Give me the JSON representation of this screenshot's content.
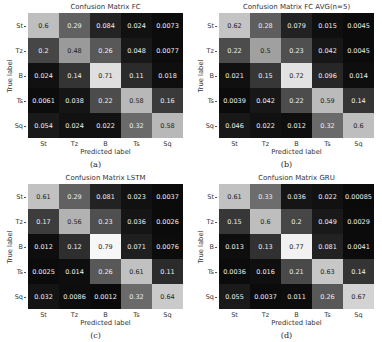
{
  "chart_data": [
    {
      "type": "heatmap",
      "title": "Confusion Matrix FC",
      "xlabel": "Predicted label",
      "ylabel": "True label",
      "x_categories": [
        "St",
        "Tz",
        "B",
        "Ts",
        "Sq"
      ],
      "y_categories": [
        "St",
        "Tz",
        "B",
        "Ts",
        "Sq"
      ],
      "values": [
        [
          "0.6",
          "0.29",
          "0.084",
          "0.024",
          "0.0073"
        ],
        [
          "0.2",
          "0.48",
          "0.26",
          "0.048",
          "0.0077"
        ],
        [
          "0.024",
          "0.14",
          "0.71",
          "0.11",
          "0.018"
        ],
        [
          "0.0061",
          "0.038",
          "0.22",
          "0.58",
          "0.16"
        ],
        [
          "0.054",
          "0.024",
          "0.022",
          "0.32",
          "0.58"
        ]
      ],
      "colormap": "grayscale",
      "caption": "(a)"
    },
    {
      "type": "heatmap",
      "title": "Confusion Matrix FC AVG(n=5)",
      "xlabel": "Predicted label",
      "ylabel": "True label",
      "x_categories": [
        "St",
        "Tz",
        "B",
        "Ts",
        "Sq"
      ],
      "y_categories": [
        "St",
        "Tz",
        "B",
        "Ts",
        "Sq"
      ],
      "values": [
        [
          "0.62",
          "0.28",
          "0.079",
          "0.015",
          "0.0045"
        ],
        [
          "0.22",
          "0.5",
          "0.23",
          "0.042",
          "0.0045"
        ],
        [
          "0.021",
          "0.15",
          "0.72",
          "0.096",
          "0.014"
        ],
        [
          "0.0039",
          "0.042",
          "0.22",
          "0.59",
          "0.14"
        ],
        [
          "0.046",
          "0.022",
          "0.012",
          "0.32",
          "0.6"
        ]
      ],
      "colormap": "grayscale",
      "caption": "(b)"
    },
    {
      "type": "heatmap",
      "title": "Confusion Matrix LSTM",
      "xlabel": "Predicted label",
      "ylabel": "True label",
      "x_categories": [
        "St",
        "Tz",
        "B",
        "Ts",
        "Sq"
      ],
      "y_categories": [
        "St",
        "Tz",
        "B",
        "Ts",
        "Sq"
      ],
      "values": [
        [
          "0.61",
          "0.29",
          "0.081",
          "0.023",
          "0.0037"
        ],
        [
          "0.17",
          "0.56",
          "0.23",
          "0.036",
          "0.0026"
        ],
        [
          "0.012",
          "0.12",
          "0.79",
          "0.071",
          "0.0076"
        ],
        [
          "0.0025",
          "0.014",
          "0.26",
          "0.61",
          "0.11"
        ],
        [
          "0.032",
          "0.0086",
          "0.0012",
          "0.32",
          "0.64"
        ]
      ],
      "colormap": "grayscale",
      "caption": "(c)"
    },
    {
      "type": "heatmap",
      "title": "Confusion Matrix GRU",
      "xlabel": "Predicted label",
      "ylabel": "True label",
      "x_categories": [
        "St",
        "Tz",
        "B",
        "Ts",
        "Sq"
      ],
      "y_categories": [
        "St",
        "Tz",
        "B",
        "Ts",
        "Sq"
      ],
      "values": [
        [
          "0.61",
          "0.33",
          "0.036",
          "0.022",
          "0.00085"
        ],
        [
          "0.15",
          "0.6",
          "0.2",
          "0.049",
          "0.0029"
        ],
        [
          "0.013",
          "0.13",
          "0.77",
          "0.081",
          "0.0041"
        ],
        [
          "0.0036",
          "0.016",
          "0.21",
          "0.63",
          "0.14"
        ],
        [
          "0.055",
          "0.0037",
          "0.011",
          "0.26",
          "0.67"
        ]
      ],
      "colormap": "grayscale",
      "caption": "(d)"
    }
  ]
}
